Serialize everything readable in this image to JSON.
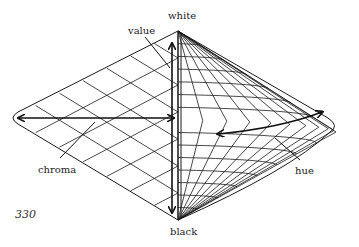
{
  "figure": {
    "labels": {
      "top": "white",
      "bottom": "black",
      "value": "value",
      "chroma": "chroma",
      "hue": "hue"
    },
    "page_number": "330"
  },
  "colors": {
    "line": "#1a1a1a",
    "text": "#222222",
    "background": "#ffffff"
  }
}
